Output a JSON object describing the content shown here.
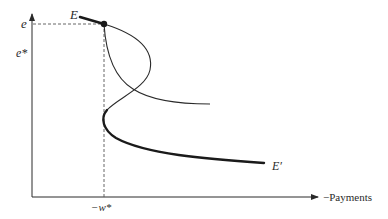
{
  "figure": {
    "type": "economic-diagram",
    "axes": {
      "y_axis_label": "",
      "x_axis_label": "−Payments",
      "y_ticks": [
        {
          "label": "e",
          "role": "equilibrium exchange rate"
        },
        {
          "label": "e*",
          "role": "reference exchange rate"
        }
      ],
      "x_ticks": [
        {
          "label": "−w*",
          "role": "reference payments level"
        }
      ]
    },
    "points": [
      {
        "label": "E",
        "description": "initial point at intersection of curves (marked with dot)"
      },
      {
        "label": "E′",
        "description": "end point of thick lower curve"
      }
    ],
    "curves": [
      {
        "name": "thin-curve-bulging-right",
        "style": "thin",
        "description": "from E bulges right then bends back left toward −w* and continues into thick lower branch"
      },
      {
        "name": "thin-curve-falling",
        "style": "thin",
        "description": "from E falls down-right, crossing the other curve, and flattens out to the right"
      },
      {
        "name": "thick-path",
        "style": "thick",
        "description": "thick segment ending at E and thick lower branch ending at E′"
      }
    ],
    "guides": [
      {
        "style": "dashed",
        "orientation": "horizontal",
        "at": "e"
      },
      {
        "style": "dashed",
        "orientation": "vertical",
        "at": "−w*"
      }
    ]
  },
  "labels": {
    "e": "e",
    "e_star": "e*",
    "E": "E",
    "E_prime": "E′",
    "w_star": "−w*",
    "x_axis": "−Payments"
  },
  "colors": {
    "ink": "#2a2a2a",
    "background": "#ffffff",
    "guide": "#555555"
  }
}
